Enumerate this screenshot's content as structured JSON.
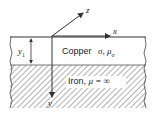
{
  "diagram": {
    "axes": {
      "x_label": "x",
      "y_label": "y",
      "z_label": "z"
    },
    "dimension": {
      "label": "y",
      "subscript": "1"
    },
    "regions": {
      "copper": {
        "name": "Copper",
        "properties": "σ, μ",
        "subscript": "o"
      },
      "iron": {
        "name": "Iron,",
        "property": "μ = ∞"
      }
    },
    "colors": {
      "line": "#333333",
      "hatch": "#555555",
      "background": "#ffffff"
    }
  }
}
